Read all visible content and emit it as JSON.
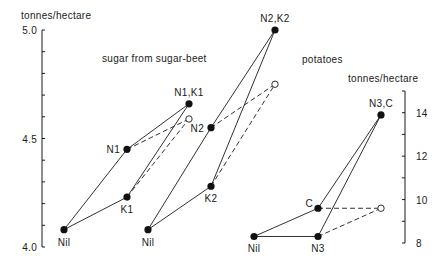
{
  "chart_data": {
    "type": "scatter",
    "title": "",
    "annotations": {
      "sugar_beet": "sugar from sugar-beet",
      "potatoes": "potatoes"
    },
    "left_axis": {
      "label": "tonnes/hectare",
      "range": [
        4.0,
        5.0
      ],
      "tick_labels": [
        {
          "value": 5.0,
          "text": "5.0"
        },
        {
          "value": 4.5,
          "text": "4.5"
        },
        {
          "value": 4.0,
          "text": "4.0"
        }
      ],
      "minor_step": 0.1
    },
    "right_axis": {
      "label": "tonnes/hectare",
      "range": [
        8,
        15
      ],
      "tick_labels": [
        {
          "value": 14,
          "text": "14"
        },
        {
          "value": 12,
          "text": "12"
        },
        {
          "value": 10,
          "text": "10"
        },
        {
          "value": 8,
          "text": "8"
        }
      ],
      "minor_step": 1
    },
    "groups": [
      {
        "name": "sugar from sugar-beet (N1, K1)",
        "axis": "left",
        "points": [
          {
            "id": "nil",
            "label": "Nil",
            "value": 4.08,
            "col": 0,
            "label_pos": "below",
            "open": false
          },
          {
            "id": "n",
            "label": "N1",
            "value": 4.45,
            "col": 1,
            "label_pos": "left",
            "open": false
          },
          {
            "id": "k",
            "label": "K1",
            "value": 4.23,
            "col": 1,
            "label_pos": "below",
            "open": false
          },
          {
            "id": "nk",
            "label": "N1,K1",
            "value": 4.66,
            "col": 2,
            "label_pos": "above",
            "open": false
          },
          {
            "id": "pred",
            "label": "",
            "value": 4.59,
            "col": 2,
            "label_pos": "none",
            "open": true
          }
        ],
        "solid": [
          [
            "nil",
            "n"
          ],
          [
            "nil",
            "k"
          ],
          [
            "n",
            "nk"
          ],
          [
            "k",
            "nk"
          ]
        ],
        "dashed": [
          [
            "n",
            "pred"
          ],
          [
            "k",
            "pred"
          ]
        ]
      },
      {
        "name": "sugar from sugar-beet (N2, K2)",
        "axis": "left",
        "points": [
          {
            "id": "nil",
            "label": "Nil",
            "value": 4.08,
            "col": 0,
            "label_pos": "below",
            "open": false
          },
          {
            "id": "n",
            "label": "N2",
            "value": 4.55,
            "col": 1,
            "label_pos": "left",
            "open": false
          },
          {
            "id": "k",
            "label": "K2",
            "value": 4.28,
            "col": 1,
            "label_pos": "below",
            "open": false
          },
          {
            "id": "nk",
            "label": "N2,K2",
            "value": 5.0,
            "col": 2,
            "label_pos": "above",
            "open": false
          },
          {
            "id": "pred",
            "label": "",
            "value": 4.75,
            "col": 2,
            "label_pos": "none",
            "open": true
          }
        ],
        "solid": [
          [
            "nil",
            "n"
          ],
          [
            "nil",
            "k"
          ],
          [
            "n",
            "nk"
          ],
          [
            "k",
            "nk"
          ]
        ],
        "dashed": [
          [
            "n",
            "pred"
          ],
          [
            "k",
            "pred"
          ]
        ]
      },
      {
        "name": "potatoes (N3, C)",
        "axis": "right",
        "points": [
          {
            "id": "nil",
            "label": "Nil",
            "value": 8.3,
            "col": 0,
            "label_pos": "below",
            "open": false
          },
          {
            "id": "c",
            "label": "C",
            "value": 9.6,
            "col": 1,
            "label_pos": "upper-left",
            "open": false
          },
          {
            "id": "n",
            "label": "N3",
            "value": 8.3,
            "col": 1,
            "label_pos": "below",
            "open": false
          },
          {
            "id": "nc",
            "label": "N3,C",
            "value": 13.9,
            "col": 2,
            "label_pos": "above",
            "open": false
          },
          {
            "id": "pred",
            "label": "",
            "value": 9.6,
            "col": 2,
            "label_pos": "none",
            "open": true
          }
        ],
        "solid": [
          [
            "nil",
            "c"
          ],
          [
            "nil",
            "n"
          ],
          [
            "c",
            "nc"
          ],
          [
            "n",
            "nc"
          ]
        ],
        "dashed": [
          [
            "c",
            "pred"
          ],
          [
            "n",
            "pred"
          ]
        ]
      }
    ],
    "legend": null,
    "grid": false
  }
}
